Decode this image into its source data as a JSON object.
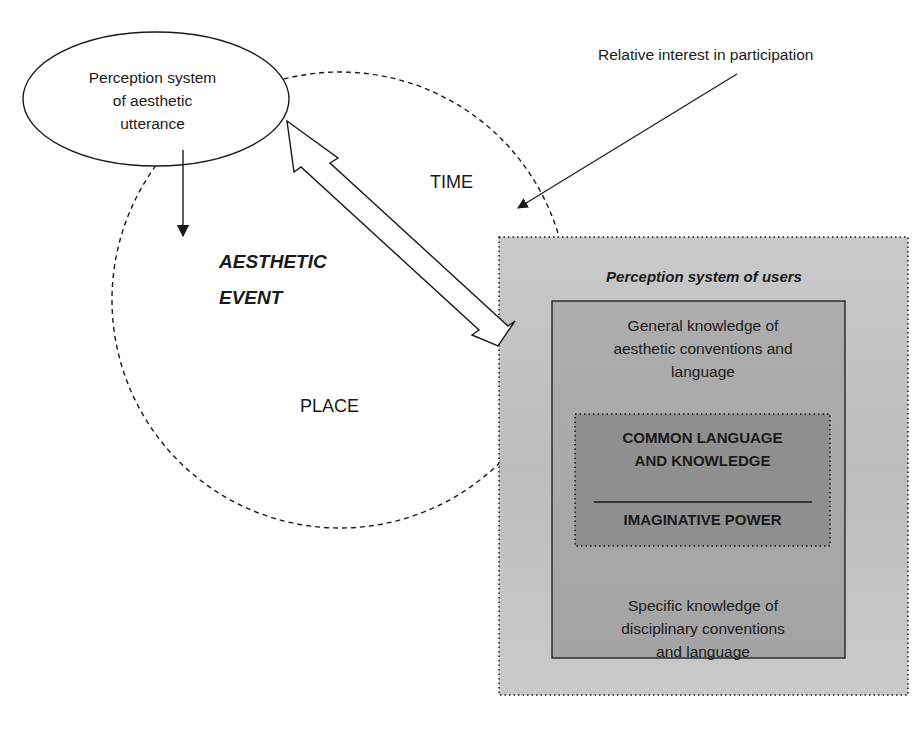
{
  "diagram": {
    "nodes": {
      "utterance_perception": {
        "label": "Perception system of aesthetic utterance",
        "lines": [
          "Perception system",
          "of aesthetic",
          "utterance"
        ],
        "shape": "ellipse"
      },
      "aesthetic_event": {
        "lines": [
          "AESTHETIC",
          "EVENT"
        ],
        "shape": "dashed-circle"
      },
      "time": {
        "label": "TIME"
      },
      "place": {
        "label": "PLACE"
      },
      "relative_interest": {
        "label": "Relative interest in participation"
      },
      "users_perception": {
        "title": "Perception system of users",
        "shape": "dotted-box",
        "general_knowledge": {
          "lines": [
            "General knowledge of",
            "aesthetic conventions and",
            "language"
          ]
        },
        "core": {
          "common_lines": [
            "COMMON LANGUAGE",
            "AND KNOWLEDGE"
          ],
          "imaginative": "IMAGINATIVE POWER"
        },
        "specific_knowledge": {
          "lines": [
            "Specific knowledge of",
            "disciplinary conventions",
            "and language"
          ]
        }
      }
    },
    "edges": [
      {
        "from": "utterance_perception",
        "to": "aesthetic_event",
        "type": "arrow"
      },
      {
        "from": "utterance_perception",
        "to": "users_perception",
        "type": "double-hollow-arrow"
      },
      {
        "from": "relative_interest",
        "to": "aesthetic_event",
        "type": "arrow"
      }
    ],
    "colors": {
      "outer_box": "#c4c4c4",
      "knowledge_box": "#a9a9a9",
      "core_box": "#8f8f8f",
      "stroke": "#1a1a1a"
    }
  }
}
